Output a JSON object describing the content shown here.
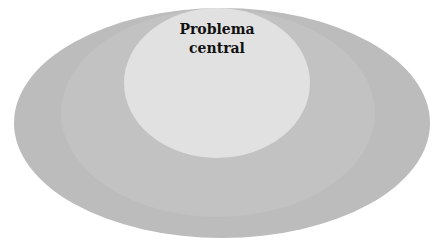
{
  "diagram": {
    "type": "nested-ellipses",
    "layers": [
      {
        "name": "outer",
        "color": "#bcbcbc",
        "cx": 222,
        "cy": 123,
        "rx": 208,
        "ry": 115
      },
      {
        "name": "middle",
        "color": "#c2c2c2",
        "cx": 218,
        "cy": 113,
        "rx": 157,
        "ry": 104
      },
      {
        "name": "inner",
        "color": "#e1e1e1",
        "cx": 217,
        "cy": 83,
        "rx": 93,
        "ry": 75
      }
    ],
    "center_label": {
      "line1": "Problema",
      "line2": "central"
    }
  }
}
